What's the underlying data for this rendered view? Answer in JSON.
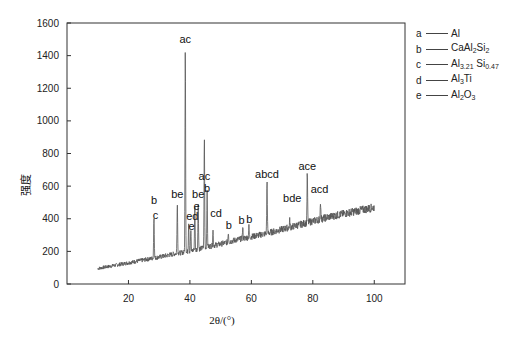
{
  "chart_data": {
    "type": "line",
    "title": "",
    "xlabel": "2θ/(°)",
    "ylabel": "强度",
    "xlim": [
      0,
      110
    ],
    "ylim": [
      0,
      1600
    ],
    "xticks": [
      20,
      40,
      60,
      80,
      100
    ],
    "yticks": [
      0,
      200,
      400,
      600,
      800,
      1000,
      1200,
      1400,
      1600
    ],
    "grid": false,
    "legend_position": "right-top",
    "series": [
      {
        "name": "XRD pattern",
        "baseline": [
          [
            10,
            95
          ],
          [
            20,
            130
          ],
          [
            30,
            165
          ],
          [
            35,
            185
          ],
          [
            40,
            200
          ],
          [
            45,
            225
          ],
          [
            50,
            245
          ],
          [
            55,
            270
          ],
          [
            60,
            290
          ],
          [
            65,
            310
          ],
          [
            70,
            335
          ],
          [
            75,
            360
          ],
          [
            80,
            385
          ],
          [
            85,
            410
          ],
          [
            90,
            430
          ],
          [
            95,
            450
          ],
          [
            100,
            470
          ]
        ],
        "peaks": [
          {
            "x": 28.3,
            "y": 420,
            "label": "b c"
          },
          {
            "x": 35.9,
            "y": 505,
            "label": "be"
          },
          {
            "x": 38.5,
            "y": 1460,
            "label": "ac"
          },
          {
            "x": 39.6,
            "y": 380,
            "label": "ed"
          },
          {
            "x": 40.3,
            "y": 330,
            "label": "e"
          },
          {
            "x": 41.6,
            "y": 480,
            "label": "e"
          },
          {
            "x": 42.7,
            "y": 500,
            "label": "be"
          },
          {
            "x": 44.7,
            "y": 895,
            "label": "ac"
          },
          {
            "x": 45.6,
            "y": 560,
            "label": "b"
          },
          {
            "x": 47.5,
            "y": 330,
            "label": "cd"
          },
          {
            "x": 52.5,
            "y": 320,
            "label": "b"
          },
          {
            "x": 57.2,
            "y": 340,
            "label": "b"
          },
          {
            "x": 59.2,
            "y": 350,
            "label": "b"
          },
          {
            "x": 65.1,
            "y": 630,
            "label": "abcd"
          },
          {
            "x": 72.5,
            "y": 390,
            "label": "bde"
          },
          {
            "x": 78.2,
            "y": 680,
            "label": "ace"
          },
          {
            "x": 82.5,
            "y": 510,
            "label": "acd"
          }
        ]
      }
    ],
    "annotations": [
      {
        "text": "ac",
        "x": 38.5,
        "y": 1480
      },
      {
        "text": "ac",
        "x": 44.7,
        "y": 640
      },
      {
        "text": "b",
        "x": 45.6,
        "y": 565
      },
      {
        "text": "be",
        "x": 35.9,
        "y": 530
      },
      {
        "text": "be",
        "x": 42.7,
        "y": 530
      },
      {
        "text": "b",
        "x": 28.3,
        "y": 490
      },
      {
        "text": "c",
        "x": 28.8,
        "y": 400
      },
      {
        "text": "e",
        "x": 42.2,
        "y": 455
      },
      {
        "text": "ed",
        "x": 40.8,
        "y": 395
      },
      {
        "text": "e",
        "x": 40.5,
        "y": 330
      },
      {
        "text": "cd",
        "x": 48.5,
        "y": 410
      },
      {
        "text": "b",
        "x": 52.7,
        "y": 340
      },
      {
        "text": "b",
        "x": 56.8,
        "y": 370
      },
      {
        "text": "b",
        "x": 59.3,
        "y": 375
      },
      {
        "text": "abcd",
        "x": 65.1,
        "y": 650
      },
      {
        "text": "bde",
        "x": 73.3,
        "y": 500
      },
      {
        "text": "ace",
        "x": 78.2,
        "y": 700
      },
      {
        "text": "acd",
        "x": 82.2,
        "y": 560
      }
    ]
  },
  "legend": [
    {
      "key": "a",
      "name": "Al",
      "parts": [
        [
          "Al",
          ""
        ]
      ]
    },
    {
      "key": "b",
      "name": "CaAl2Si2",
      "parts": [
        [
          "CaAl",
          "2"
        ],
        [
          "Si",
          "2"
        ]
      ]
    },
    {
      "key": "c",
      "name": "Al3.21Si0.47",
      "parts": [
        [
          "Al",
          "3.21"
        ],
        [
          " Si",
          "0.47"
        ]
      ]
    },
    {
      "key": "d",
      "name": "Al3Ti",
      "parts": [
        [
          "Al",
          "3"
        ],
        [
          "Ti",
          ""
        ]
      ]
    },
    {
      "key": "e",
      "name": "Al2O3",
      "parts": [
        [
          "Al",
          "2"
        ],
        [
          "O",
          "3"
        ]
      ]
    }
  ]
}
